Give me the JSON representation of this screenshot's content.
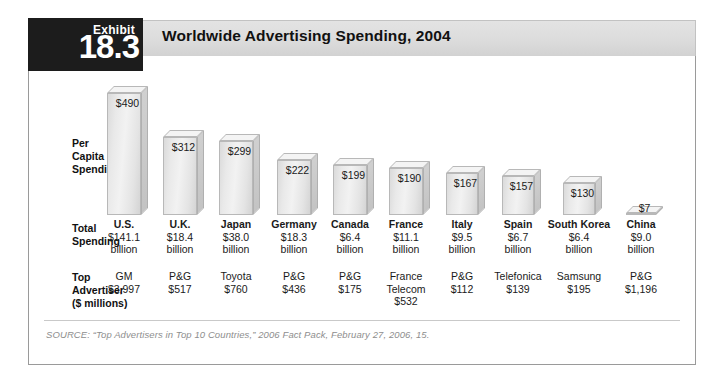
{
  "exhibit": {
    "tab_word": "Exhibit",
    "tab_number": "18.3",
    "title": "Worldwide Advertising Spending, 2004"
  },
  "row_labels": {
    "per_capita": "Per\nCapita\nSpending",
    "total": "Total\nSpending",
    "top_advertiser": "Top\nAdvertiser\n($ millions)"
  },
  "source": "SOURCE: “Top Advertisers in Top 10 Countries,” 2006 Fact Pack, February 27, 2006, 15.",
  "chart_data": {
    "type": "bar",
    "title": "Worldwide Advertising Spending, 2004",
    "xlabel": "",
    "ylabel": "Per Capita Spending",
    "ylim": [
      0,
      490
    ],
    "grid": false,
    "legend": "none",
    "categories": [
      "U.S.",
      "U.K.",
      "Japan",
      "Germany",
      "Canada",
      "France",
      "Italy",
      "Spain",
      "South Korea",
      "China"
    ],
    "values": [
      490,
      312,
      299,
      222,
      199,
      190,
      167,
      157,
      130,
      7
    ],
    "value_labels": [
      "$490",
      "$312",
      "$299",
      "$222",
      "$199",
      "$190",
      "$167",
      "$157",
      "$130",
      "$7"
    ],
    "series": [
      {
        "name": "Per Capita Spending",
        "values": [
          490,
          312,
          299,
          222,
          199,
          190,
          167,
          157,
          130,
          7
        ]
      }
    ],
    "rows": [
      {
        "country": "U.S.",
        "per_capita": "$490",
        "total_amount": "$141.1",
        "total_unit": "billion",
        "advertiser": [
          "GM",
          "$3,997"
        ]
      },
      {
        "country": "U.K.",
        "per_capita": "$312",
        "total_amount": "$18.4",
        "total_unit": "billion",
        "advertiser": [
          "P&G",
          "$517"
        ]
      },
      {
        "country": "Japan",
        "per_capita": "$299",
        "total_amount": "$38.0",
        "total_unit": "billion",
        "advertiser": [
          "Toyota",
          "$760"
        ]
      },
      {
        "country": "Germany",
        "per_capita": "$222",
        "total_amount": "$18.3",
        "total_unit": "billion",
        "advertiser": [
          "P&G",
          "$436"
        ]
      },
      {
        "country": "Canada",
        "per_capita": "$199",
        "total_amount": "$6.4",
        "total_unit": "billion",
        "advertiser": [
          "P&G",
          "$175"
        ]
      },
      {
        "country": "France",
        "per_capita": "$190",
        "total_amount": "$11.1",
        "total_unit": "billion",
        "advertiser": [
          "France",
          "Telecom",
          "$532"
        ]
      },
      {
        "country": "Italy",
        "per_capita": "$167",
        "total_amount": "$9.5",
        "total_unit": "billion",
        "advertiser": [
          "P&G",
          "$112"
        ]
      },
      {
        "country": "Spain",
        "per_capita": "$157",
        "total_amount": "$6.7",
        "total_unit": "billion",
        "advertiser": [
          "Telefonica",
          "$139"
        ]
      },
      {
        "country": "South Korea",
        "per_capita": "$130",
        "total_amount": "$6.4",
        "total_unit": "billion",
        "advertiser": [
          "Samsung",
          "$195"
        ]
      },
      {
        "country": "China",
        "per_capita": "$7",
        "total_amount": "$9.0",
        "total_unit": "billion",
        "advertiser": [
          "P&G",
          "$1,196"
        ]
      }
    ]
  },
  "colors": {
    "tab_background": "#1c1c1c",
    "title_band": "#dcdcdc",
    "bar_face": "#ebebeb",
    "bar_side": "#c7c7c7",
    "frame_border": "#9a9a9a",
    "source_text": "#8e8e8e"
  }
}
